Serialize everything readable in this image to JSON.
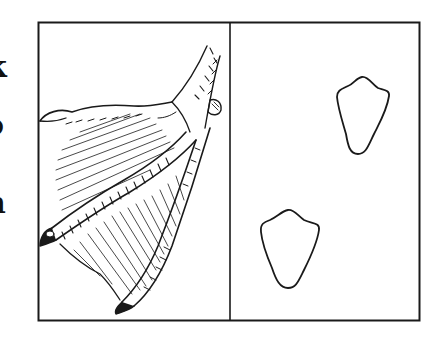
{
  "figure": {
    "panels": [
      {
        "name": "duck-foot-illustration",
        "subject": "webbed duck foot drawing"
      },
      {
        "name": "footprints-panel",
        "subject": "two footprint outlines"
      }
    ],
    "edge_text_fragments": [
      "k",
      "o",
      "n",
      ":"
    ],
    "colors": {
      "ink": "#1a1a1a",
      "paper": "#ffffff"
    }
  }
}
